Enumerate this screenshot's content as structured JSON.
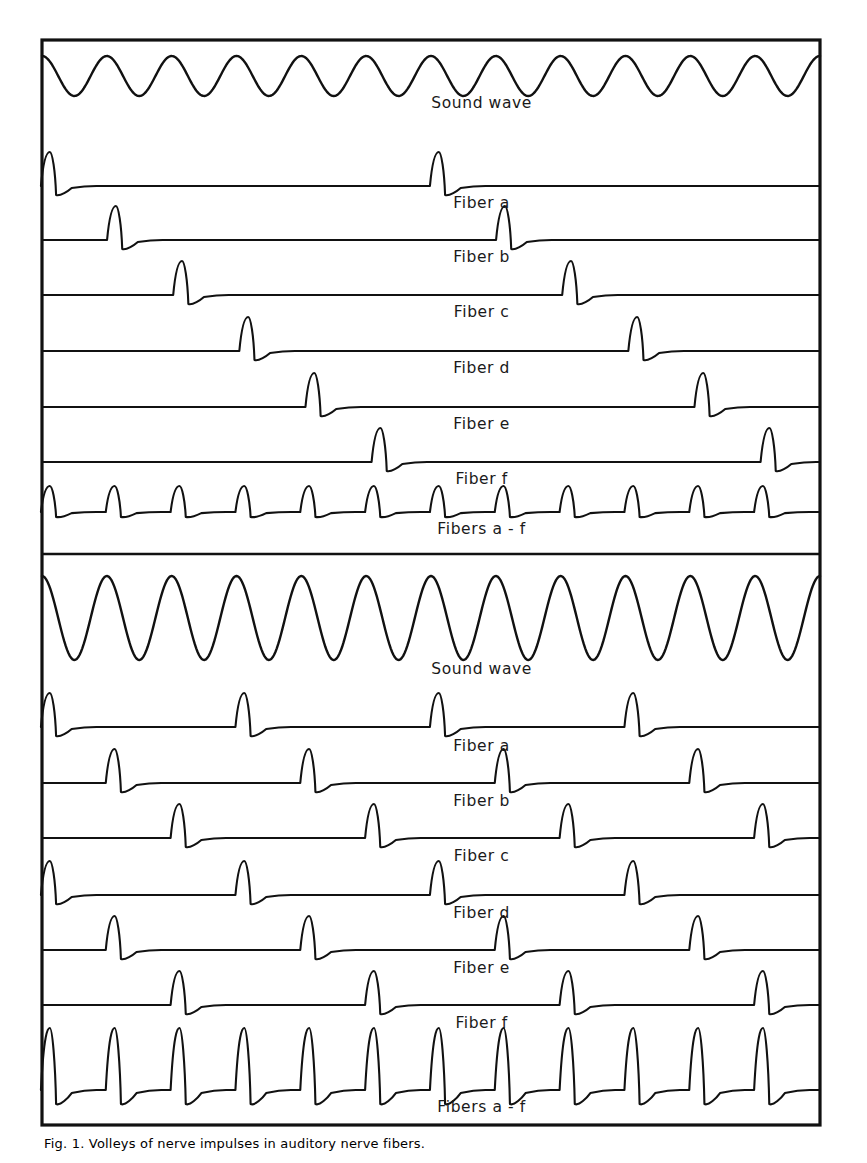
{
  "figure": {
    "title_caption": "Fig. 1. Volleys of nerve impulses in auditory nerve fibers.",
    "frame": {
      "x": 42,
      "y": 40,
      "width": 778,
      "height": 1085,
      "border_color": "#111111"
    },
    "divider_y": 554,
    "stroke_color": "#111111",
    "background_color": "#ffffff"
  },
  "panels": [
    {
      "id": "upper-panel",
      "name": "low-frequency-panel",
      "cycles": 12,
      "traces": [
        {
          "id": "sound-wave-upper",
          "label": "Sound wave",
          "kind": "sine",
          "baseline_y": 76,
          "amplitude": 20,
          "cycles": 12,
          "phase": 0.0,
          "label_y": 108
        },
        {
          "id": "fiber-a-upper",
          "label": "Fiber a",
          "kind": "spikes",
          "baseline_y": 186,
          "amplitude": 34,
          "undershoot": 9,
          "spike_cycles": [
            0,
            6
          ],
          "cycle_offset": 0.02,
          "label_y": 208
        },
        {
          "id": "fiber-b-upper",
          "label": "Fiber b",
          "kind": "spikes",
          "baseline_y": 240,
          "amplitude": 34,
          "undershoot": 9,
          "spike_cycles": [
            1,
            7
          ],
          "cycle_offset": 0.04,
          "label_y": 262
        },
        {
          "id": "fiber-c-upper",
          "label": "Fiber c",
          "kind": "spikes",
          "baseline_y": 295,
          "amplitude": 34,
          "undershoot": 9,
          "spike_cycles": [
            2,
            8
          ],
          "cycle_offset": 0.06,
          "label_y": 317
        },
        {
          "id": "fiber-d-upper",
          "label": "Fiber d",
          "kind": "spikes",
          "baseline_y": 351,
          "amplitude": 34,
          "undershoot": 9,
          "spike_cycles": [
            3,
            9
          ],
          "cycle_offset": 0.08,
          "label_y": 373
        },
        {
          "id": "fiber-e-upper",
          "label": "Fiber e",
          "kind": "spikes",
          "baseline_y": 407,
          "amplitude": 34,
          "undershoot": 9,
          "spike_cycles": [
            4,
            10
          ],
          "cycle_offset": 0.1,
          "label_y": 429
        },
        {
          "id": "fiber-f-upper",
          "label": "Fiber f",
          "kind": "spikes",
          "baseline_y": 462,
          "amplitude": 34,
          "undershoot": 9,
          "spike_cycles": [
            5,
            11
          ],
          "cycle_offset": 0.12,
          "label_y": 484
        },
        {
          "id": "fibers-a-f-upper",
          "label": "Fibers a - f",
          "kind": "spikes",
          "baseline_y": 512,
          "amplitude": 26,
          "undershoot": 5,
          "spike_cycles": [
            0,
            1,
            2,
            3,
            4,
            5,
            6,
            7,
            8,
            9,
            10,
            11
          ],
          "cycle_offset": 0.02,
          "label_y": 534
        }
      ]
    },
    {
      "id": "lower-panel",
      "name": "high-frequency-panel",
      "cycles": 12,
      "traces": [
        {
          "id": "sound-wave-lower",
          "label": "Sound wave",
          "kind": "sine",
          "baseline_y": 618,
          "amplitude": 42,
          "cycles": 12,
          "phase": 0.0,
          "label_y": 674
        },
        {
          "id": "fiber-a-lower",
          "label": "Fiber a",
          "kind": "spikes",
          "baseline_y": 727,
          "amplitude": 34,
          "undershoot": 9,
          "spike_cycles": [
            0,
            3,
            6,
            9
          ],
          "cycle_offset": 0.02,
          "label_y": 751
        },
        {
          "id": "fiber-b-lower",
          "label": "Fiber b",
          "kind": "spikes",
          "baseline_y": 783,
          "amplitude": 34,
          "undershoot": 9,
          "spike_cycles": [
            1,
            4,
            7,
            10
          ],
          "cycle_offset": 0.02,
          "label_y": 806
        },
        {
          "id": "fiber-c-lower",
          "label": "Fiber c",
          "kind": "spikes",
          "baseline_y": 838,
          "amplitude": 34,
          "undershoot": 9,
          "spike_cycles": [
            2,
            5,
            8,
            11
          ],
          "cycle_offset": 0.02,
          "label_y": 861
        },
        {
          "id": "fiber-d-lower",
          "label": "Fiber d",
          "kind": "spikes",
          "baseline_y": 895,
          "amplitude": 34,
          "undershoot": 9,
          "spike_cycles": [
            0,
            3,
            6,
            9
          ],
          "cycle_offset": 0.02,
          "label_y": 918
        },
        {
          "id": "fiber-e-lower",
          "label": "Fiber e",
          "kind": "spikes",
          "baseline_y": 950,
          "amplitude": 34,
          "undershoot": 9,
          "spike_cycles": [
            1,
            4,
            7,
            10
          ],
          "cycle_offset": 0.02,
          "label_y": 973
        },
        {
          "id": "fiber-f-lower",
          "label": "Fiber f",
          "kind": "spikes",
          "baseline_y": 1005,
          "amplitude": 34,
          "undershoot": 9,
          "spike_cycles": [
            2,
            5,
            8,
            11
          ],
          "cycle_offset": 0.02,
          "label_y": 1028
        },
        {
          "id": "fibers-a-f-lower",
          "label": "Fibers a - f",
          "kind": "spikes",
          "baseline_y": 1090,
          "amplitude": 62,
          "undershoot": 14,
          "spike_cycles": [
            0,
            1,
            2,
            3,
            4,
            5,
            6,
            7,
            8,
            9,
            10,
            11
          ],
          "cycle_offset": 0.02,
          "label_y": 1112
        }
      ]
    }
  ],
  "chart_data": {
    "type": "line",
    "xlabel": "",
    "ylabel": "",
    "grid": false,
    "legend": "none",
    "panels": [
      {
        "name": "Upper panel (lower sound frequency)",
        "sound_wave": {
          "cycles": 12,
          "relative_amplitude": 1.0,
          "shape": "sinusoid"
        },
        "series": [
          {
            "name": "Sound wave",
            "spike_cycles": []
          },
          {
            "name": "Fiber a",
            "spike_cycles": [
              0,
              6
            ],
            "spikes_per_12_cycles": 2
          },
          {
            "name": "Fiber b",
            "spike_cycles": [
              1,
              7
            ],
            "spikes_per_12_cycles": 2
          },
          {
            "name": "Fiber c",
            "spike_cycles": [
              2,
              8
            ],
            "spikes_per_12_cycles": 2
          },
          {
            "name": "Fiber d",
            "spike_cycles": [
              3,
              9
            ],
            "spikes_per_12_cycles": 2
          },
          {
            "name": "Fiber e",
            "spike_cycles": [
              4,
              10
            ],
            "spikes_per_12_cycles": 2
          },
          {
            "name": "Fiber f",
            "spike_cycles": [
              5,
              11
            ],
            "spikes_per_12_cycles": 2
          },
          {
            "name": "Fibers a - f",
            "spike_cycles": [
              0,
              1,
              2,
              3,
              4,
              5,
              6,
              7,
              8,
              9,
              10,
              11
            ],
            "spikes_per_12_cycles": 12,
            "relative_spike_height": 0.45
          }
        ]
      },
      {
        "name": "Lower panel (higher sound amplitude/frequency)",
        "sound_wave": {
          "cycles": 12,
          "relative_amplitude": 2.1,
          "shape": "sinusoid"
        },
        "series": [
          {
            "name": "Sound wave",
            "spike_cycles": []
          },
          {
            "name": "Fiber a",
            "spike_cycles": [
              0,
              3,
              6,
              9
            ],
            "spikes_per_12_cycles": 4
          },
          {
            "name": "Fiber b",
            "spike_cycles": [
              1,
              4,
              7,
              10
            ],
            "spikes_per_12_cycles": 4
          },
          {
            "name": "Fiber c",
            "spike_cycles": [
              2,
              5,
              8,
              11
            ],
            "spikes_per_12_cycles": 4
          },
          {
            "name": "Fiber d",
            "spike_cycles": [
              0,
              3,
              6,
              9
            ],
            "spikes_per_12_cycles": 4
          },
          {
            "name": "Fiber e",
            "spike_cycles": [
              1,
              4,
              7,
              10
            ],
            "spikes_per_12_cycles": 4
          },
          {
            "name": "Fiber f",
            "spike_cycles": [
              2,
              5,
              8,
              11
            ],
            "spikes_per_12_cycles": 4
          },
          {
            "name": "Fibers a - f",
            "spike_cycles": [
              0,
              1,
              2,
              3,
              4,
              5,
              6,
              7,
              8,
              9,
              10,
              11
            ],
            "spikes_per_12_cycles": 12,
            "relative_spike_height": 1.0
          }
        ]
      }
    ]
  }
}
